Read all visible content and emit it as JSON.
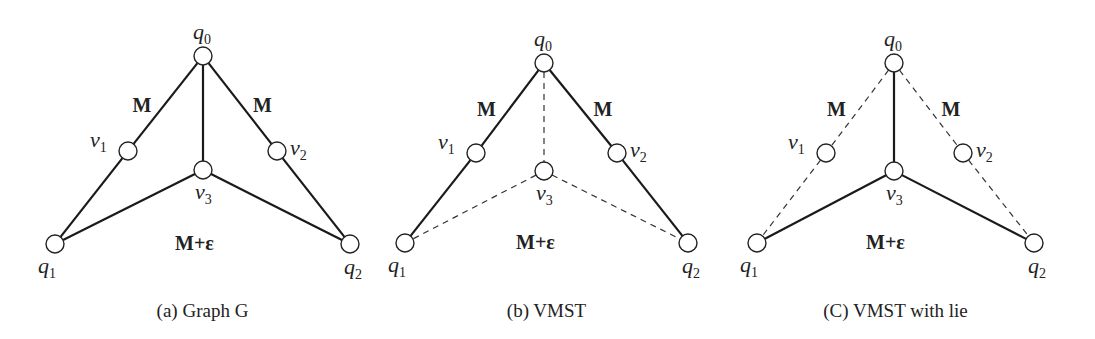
{
  "figure": {
    "panels": [
      {
        "id": "a",
        "caption": "(a) Graph G",
        "nodes": {
          "q0": {
            "label": "q",
            "sub": "0",
            "x": 203,
            "y": 56
          },
          "v1": {
            "label": "v",
            "sub": "1",
            "x": 128,
            "y": 151
          },
          "v2": {
            "label": "v",
            "sub": "2",
            "x": 277,
            "y": 151
          },
          "v3": {
            "label": "v",
            "sub": "3",
            "x": 203,
            "y": 170
          },
          "q1": {
            "label": "q",
            "sub": "1",
            "x": 55,
            "y": 244
          },
          "q2": {
            "label": "q",
            "sub": "2",
            "x": 350,
            "y": 244
          }
        },
        "edges": [
          {
            "from": "q0",
            "to": "v1",
            "style": "solid"
          },
          {
            "from": "v1",
            "to": "q1",
            "style": "solid"
          },
          {
            "from": "q0",
            "to": "v2",
            "style": "solid"
          },
          {
            "from": "v2",
            "to": "q2",
            "style": "solid"
          },
          {
            "from": "q0",
            "to": "v3",
            "style": "solid"
          },
          {
            "from": "v3",
            "to": "q1",
            "style": "solid"
          },
          {
            "from": "v3",
            "to": "q2",
            "style": "solid"
          }
        ],
        "weights": {
          "left": "M",
          "right": "M",
          "bottom": "M+ε"
        }
      },
      {
        "id": "b",
        "caption": "(b) VMST",
        "nodes": {
          "q0": {
            "label": "q",
            "sub": "0",
            "x": 544,
            "y": 63
          },
          "v1": {
            "label": "v",
            "sub": "1",
            "x": 476,
            "y": 153
          },
          "v2": {
            "label": "v",
            "sub": "2",
            "x": 617,
            "y": 153
          },
          "v3": {
            "label": "v",
            "sub": "3",
            "x": 544,
            "y": 171
          },
          "q1": {
            "label": "q",
            "sub": "1",
            "x": 405,
            "y": 243
          },
          "q2": {
            "label": "q",
            "sub": "2",
            "x": 688,
            "y": 243
          }
        },
        "edges": [
          {
            "from": "q0",
            "to": "v1",
            "style": "solid"
          },
          {
            "from": "v1",
            "to": "q1",
            "style": "solid"
          },
          {
            "from": "q0",
            "to": "v2",
            "style": "solid"
          },
          {
            "from": "v2",
            "to": "q2",
            "style": "solid"
          },
          {
            "from": "q0",
            "to": "v3",
            "style": "dashed"
          },
          {
            "from": "v3",
            "to": "q1",
            "style": "dashed"
          },
          {
            "from": "v3",
            "to": "q2",
            "style": "dashed"
          }
        ],
        "weights": {
          "left": "M",
          "right": "M",
          "bottom": "M+ε"
        }
      },
      {
        "id": "c",
        "caption": "(C) VMST with lie",
        "nodes": {
          "q0": {
            "label": "q",
            "sub": "0",
            "x": 894,
            "y": 63
          },
          "v1": {
            "label": "v",
            "sub": "1",
            "x": 826,
            "y": 153
          },
          "v2": {
            "label": "v",
            "sub": "2",
            "x": 963,
            "y": 153
          },
          "v3": {
            "label": "v",
            "sub": "3",
            "x": 894,
            "y": 171
          },
          "q1": {
            "label": "q",
            "sub": "1",
            "x": 757,
            "y": 243
          },
          "q2": {
            "label": "q",
            "sub": "2",
            "x": 1034,
            "y": 243
          }
        },
        "edges": [
          {
            "from": "q0",
            "to": "v1",
            "style": "dashed"
          },
          {
            "from": "v1",
            "to": "q1",
            "style": "dashed"
          },
          {
            "from": "q0",
            "to": "v2",
            "style": "dashed"
          },
          {
            "from": "v2",
            "to": "q2",
            "style": "dashed"
          },
          {
            "from": "q0",
            "to": "v3",
            "style": "solid"
          },
          {
            "from": "v3",
            "to": "q1",
            "style": "solid"
          },
          {
            "from": "v3",
            "to": "q2",
            "style": "solid"
          }
        ],
        "weights": {
          "left": "M",
          "right": "M",
          "bottom": "M+ε"
        }
      }
    ]
  }
}
